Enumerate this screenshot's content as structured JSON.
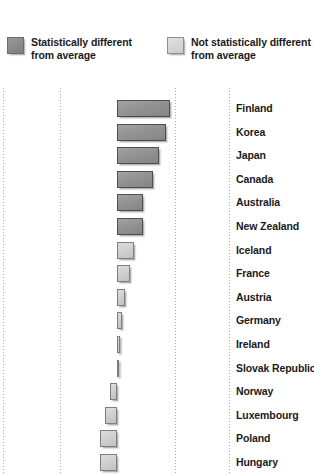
{
  "legend": {
    "items": [
      {
        "label": "Statistically different\nfrom average",
        "swatch": "dark",
        "color": "#8c8c8c"
      },
      {
        "label": "Not statistically different\nfrom average",
        "swatch": "light",
        "color": "#d2d2d2"
      }
    ]
  },
  "chart_data": {
    "type": "bar",
    "orientation": "horizontal",
    "title": "",
    "subtitle": "",
    "xlabel": "",
    "ylabel": "",
    "grid": true,
    "gridlines_x": [
      -2,
      -1,
      1,
      2
    ],
    "baseline": 0,
    "legend_position": "top",
    "categories": [
      "Finland",
      "Korea",
      "Japan",
      "Canada",
      "Australia",
      "New Zealand",
      "Iceland",
      "France",
      "Austria",
      "Germany",
      "Ireland",
      "Slovak Republic",
      "Norway",
      "Luxembourg",
      "Poland",
      "Hungary"
    ],
    "values": [
      53,
      49,
      42,
      36,
      26,
      26,
      17,
      13,
      8,
      5,
      3,
      1,
      -7,
      -12,
      -17,
      -17
    ],
    "series": [
      {
        "name": "Difference from average",
        "values": [
          53,
          49,
          42,
          36,
          26,
          26,
          17,
          13,
          8,
          5,
          3,
          1,
          -7,
          -12,
          -17,
          -17
        ],
        "significance": [
          "significant",
          "significant",
          "significant",
          "significant",
          "significant",
          "significant",
          "not-significant",
          "not-significant",
          "not-significant",
          "not-significant",
          "not-significant",
          "not-significant",
          "not-significant",
          "not-significant",
          "not-significant",
          "not-significant"
        ]
      }
    ],
    "rows": [
      {
        "label": "Finland",
        "value": 53,
        "significance": "significant"
      },
      {
        "label": "Korea",
        "value": 49,
        "significance": "significant"
      },
      {
        "label": "Japan",
        "value": 42,
        "significance": "significant"
      },
      {
        "label": "Canada",
        "value": 36,
        "significance": "significant"
      },
      {
        "label": "Australia",
        "value": 26,
        "significance": "significant"
      },
      {
        "label": "New Zealand",
        "value": 26,
        "significance": "significant"
      },
      {
        "label": "Iceland",
        "value": 17,
        "significance": "not-significant"
      },
      {
        "label": "France",
        "value": 13,
        "significance": "not-significant"
      },
      {
        "label": "Austria",
        "value": 8,
        "significance": "not-significant"
      },
      {
        "label": "Germany",
        "value": 5,
        "significance": "not-significant"
      },
      {
        "label": "Ireland",
        "value": 3,
        "significance": "not-significant"
      },
      {
        "label": "Slovak Republic",
        "value": 1,
        "significance": "not-significant"
      },
      {
        "label": "Norway",
        "value": -7,
        "significance": "not-significant"
      },
      {
        "label": "Luxembourg",
        "value": -12,
        "significance": "not-significant"
      },
      {
        "label": "Poland",
        "value": -17,
        "significance": "not-significant"
      },
      {
        "label": "Hungary",
        "value": -17,
        "significance": "not-significant"
      }
    ]
  }
}
